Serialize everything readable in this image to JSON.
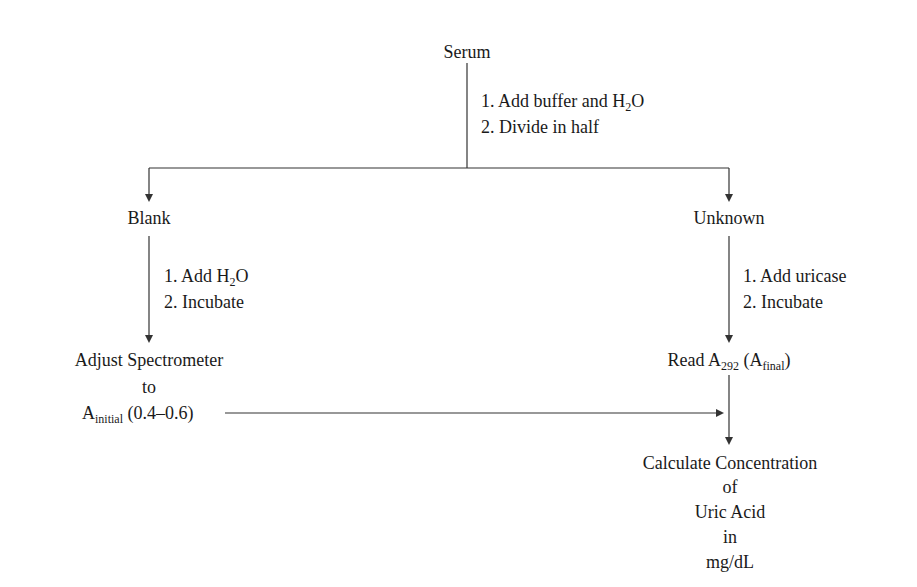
{
  "diagram": {
    "type": "flowchart",
    "nodes": {
      "serum": "Serum",
      "blank": "Blank",
      "unknown": "Unknown",
      "adjust": {
        "line1": "Adjust Spectrometer",
        "line2": "to",
        "a_main": "A",
        "a_sub": "initial",
        "range": " (0.4–0.6)"
      },
      "read": {
        "prefix": "Read A",
        "sub1": "292",
        "mid": " (A",
        "sub2": "final",
        "suffix": ")"
      },
      "calculate": {
        "line1": "Calculate Concentration",
        "line2": "of",
        "line3": "Uric Acid",
        "line4": "in",
        "line5": "mg/dL"
      }
    },
    "edges": {
      "serum_split": {
        "step1_prefix": "1.  Add buffer and H",
        "step1_sub": "2",
        "step1_suffix": "O",
        "step2": "2.  Divide in half"
      },
      "blank_to_adjust": {
        "step1_prefix": "1.  Add H",
        "step1_sub": "2",
        "step1_suffix": "O",
        "step2": "2.  Incubate"
      },
      "unknown_to_read": {
        "step1": "1.  Add uricase",
        "step2": "2.  Incubate"
      },
      "adjust_to_read": "horizontal arrow",
      "read_to_calculate": "vertical arrow"
    },
    "colors": {
      "line": "#333333",
      "text": "#1a1a1a",
      "background": "#ffffff"
    }
  }
}
